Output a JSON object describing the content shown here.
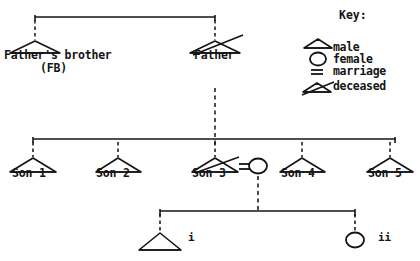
{
  "diagram": {
    "stroke_color": "#141414",
    "background_color": "#ffffff",
    "generations": [
      {
        "name": "generation-1",
        "nodes": [
          {
            "id": "fb",
            "label_line1": "Father's brother",
            "label_line2": "(FB)",
            "symbol": "male-triangle",
            "deceased": false
          },
          {
            "id": "father",
            "label_line1": "Father",
            "label_line2": "",
            "symbol": "male-triangle",
            "deceased": true
          }
        ]
      },
      {
        "name": "generation-2",
        "nodes": [
          {
            "id": "son1",
            "label": "Son 1",
            "symbol": "male-triangle",
            "deceased": false
          },
          {
            "id": "son2",
            "label": "Son 2",
            "symbol": "male-triangle",
            "deceased": false
          },
          {
            "id": "son3",
            "label": "Son 3",
            "symbol": "male-triangle",
            "deceased": true
          },
          {
            "id": "son3wife",
            "label": "",
            "symbol": "female-circle",
            "deceased": false
          },
          {
            "id": "son4",
            "label": "Son 4",
            "symbol": "male-triangle",
            "deceased": false
          },
          {
            "id": "son5",
            "label": "Son 5",
            "symbol": "male-triangle",
            "deceased": false
          }
        ],
        "marriage_symbol": "="
      },
      {
        "name": "generation-3",
        "nodes": [
          {
            "id": "child-i",
            "label": "i",
            "symbol": "male-triangle",
            "deceased": false
          },
          {
            "id": "child-ii",
            "label": "ii",
            "symbol": "female-circle",
            "deceased": false
          }
        ]
      }
    ]
  },
  "key": {
    "title": "Key:",
    "items": [
      {
        "symbol": "male-triangle",
        "label": "male"
      },
      {
        "symbol": "female-circle",
        "label": "female"
      },
      {
        "symbol": "marriage-equals",
        "label": "marriage"
      },
      {
        "symbol": "deceased-triangle",
        "label": "deceased"
      }
    ]
  }
}
